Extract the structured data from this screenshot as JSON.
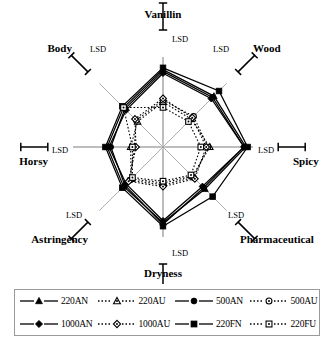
{
  "chart_data": {
    "type": "radar",
    "title": "",
    "categories": [
      "Vanillin",
      "Wood",
      "Spicy",
      "Pharmaceutical",
      "Dryness",
      "Astringency",
      "Horsy",
      "Body"
    ],
    "axis_order_degrees": [
      90,
      45,
      0,
      -45,
      -90,
      -135,
      180,
      135
    ],
    "rlim": [
      0,
      1
    ],
    "grid": false,
    "legend_position": "bottom",
    "series": [
      {
        "name": "220AN",
        "marker": "triangle-filled",
        "line": "solid",
        "values": [
          0.86,
          0.8,
          0.92,
          0.66,
          0.84,
          0.62,
          0.62,
          0.62
        ]
      },
      {
        "name": "220AU",
        "marker": "triangle-open",
        "line": "dotted",
        "values": [
          0.5,
          0.44,
          0.52,
          0.46,
          0.4,
          0.5,
          0.36,
          0.4
        ]
      },
      {
        "name": "500AN",
        "marker": "circle-filled",
        "line": "solid",
        "values": [
          0.84,
          0.78,
          0.9,
          0.64,
          0.86,
          0.6,
          0.58,
          0.6
        ]
      },
      {
        "name": "500AU",
        "marker": "circle-open",
        "line": "dotted",
        "values": [
          0.52,
          0.48,
          0.5,
          0.48,
          0.42,
          0.52,
          0.32,
          0.42
        ]
      },
      {
        "name": "1000AN",
        "marker": "diamond-filled",
        "line": "solid",
        "values": [
          0.82,
          0.76,
          0.9,
          0.62,
          0.82,
          0.58,
          0.6,
          0.58
        ]
      },
      {
        "name": "1000AU",
        "marker": "diamond-open",
        "line": "dotted",
        "values": [
          0.54,
          0.46,
          0.48,
          0.5,
          0.44,
          0.54,
          0.3,
          0.44
        ]
      },
      {
        "name": "220FN",
        "marker": "square-filled",
        "line": "solid",
        "values": [
          0.88,
          0.88,
          0.94,
          0.78,
          0.88,
          0.64,
          0.64,
          0.64
        ]
      },
      {
        "name": "220FU",
        "marker": "square-open",
        "line": "dotted",
        "values": [
          0.44,
          0.4,
          0.42,
          0.44,
          0.38,
          0.48,
          0.34,
          0.62
        ]
      }
    ],
    "error_bar_label": "LSD",
    "error_bars": [
      {
        "axis": "Vanillin",
        "label": "LSD"
      },
      {
        "axis": "Wood",
        "label": "LSD"
      },
      {
        "axis": "Spicy",
        "label": "LSD"
      },
      {
        "axis": "Pharmaceutical",
        "label": "LSD"
      },
      {
        "axis": "Dryness",
        "label": "LSD"
      },
      {
        "axis": "Astringency",
        "label": "LSD"
      },
      {
        "axis": "Horsy",
        "label": "LSD"
      },
      {
        "axis": "Body",
        "label": "LSD"
      }
    ]
  },
  "axes": {
    "vanillin": "Vanillin",
    "wood": "Wood",
    "spicy": "Spicy",
    "pharmaceutical": "Pharmaceutical",
    "dryness": "Dryness",
    "astringency": "Astringency",
    "horsy": "Horsy",
    "body": "Body"
  },
  "lsd": {
    "vanillin": "LSD",
    "wood": "LSD",
    "spicy": "LSD",
    "pharmaceutical": "LSD",
    "dryness": "LSD",
    "astringency": "LSD",
    "horsy": "LSD",
    "body": "LSD"
  },
  "legend": {
    "items": [
      {
        "label": "220AN"
      },
      {
        "label": "220AU"
      },
      {
        "label": "500AN"
      },
      {
        "label": "500AU"
      },
      {
        "label": "1000AN"
      },
      {
        "label": "1000AU"
      },
      {
        "label": "220FN"
      },
      {
        "label": "220FU"
      }
    ]
  },
  "colors": {
    "ink": "#000000",
    "spoke": "#8d8d8d",
    "legend_border": "#9a9a9a",
    "background": "#ffffff"
  }
}
